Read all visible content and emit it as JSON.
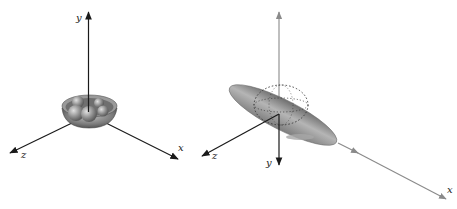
{
  "figure": {
    "panels": [
      {
        "id": "left",
        "description": "bowl with spheres at origin of 3D axes",
        "axes": {
          "x_label": "x",
          "y_label": "y",
          "z_label": "z"
        }
      },
      {
        "id": "right",
        "description": "tilted ellipsoid with dotted sphere outline at origin of 3D axes",
        "axes": {
          "x_label": "x",
          "y_label": "y",
          "z_label": "z",
          "y_up_label": ""
        }
      }
    ],
    "colors": {
      "axis_dark": "#1a1a1a",
      "axis_gray": "#8a8a8a",
      "shape_fill": "#8c8c8c",
      "background": "#ffffff"
    }
  }
}
